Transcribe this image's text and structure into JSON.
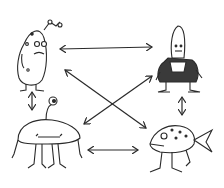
{
  "diagram": {
    "type": "network",
    "style": "hand-drawn pen sketch",
    "ink_color": "#2a2a2a",
    "background": "#ffffff",
    "nodes": [
      {
        "id": "pickle-creature",
        "position": "top-left",
        "description": "bumpy pickle-shaped creature with antenna and small feet"
      },
      {
        "id": "bullet-creature",
        "position": "top-right",
        "description": "bullet-headed creature wearing a dark suit"
      },
      {
        "id": "dome-creature",
        "position": "bottom-left",
        "description": "one-eyed dome-shaped creature with eyestalk and four legs"
      },
      {
        "id": "fish-creature",
        "position": "bottom-right",
        "description": "spotted fish creature standing on legs"
      }
    ],
    "edges": [
      {
        "from": "pickle-creature",
        "to": "bullet-creature",
        "direction": "bidirectional",
        "orientation": "horizontal"
      },
      {
        "from": "dome-creature",
        "to": "fish-creature",
        "direction": "bidirectional",
        "orientation": "horizontal"
      },
      {
        "from": "pickle-creature",
        "to": "dome-creature",
        "direction": "bidirectional",
        "orientation": "vertical"
      },
      {
        "from": "bullet-creature",
        "to": "fish-creature",
        "direction": "bidirectional",
        "orientation": "vertical"
      },
      {
        "from": "pickle-creature",
        "to": "fish-creature",
        "direction": "bidirectional",
        "orientation": "diagonal"
      },
      {
        "from": "bullet-creature",
        "to": "dome-creature",
        "direction": "bidirectional",
        "orientation": "diagonal"
      }
    ]
  }
}
